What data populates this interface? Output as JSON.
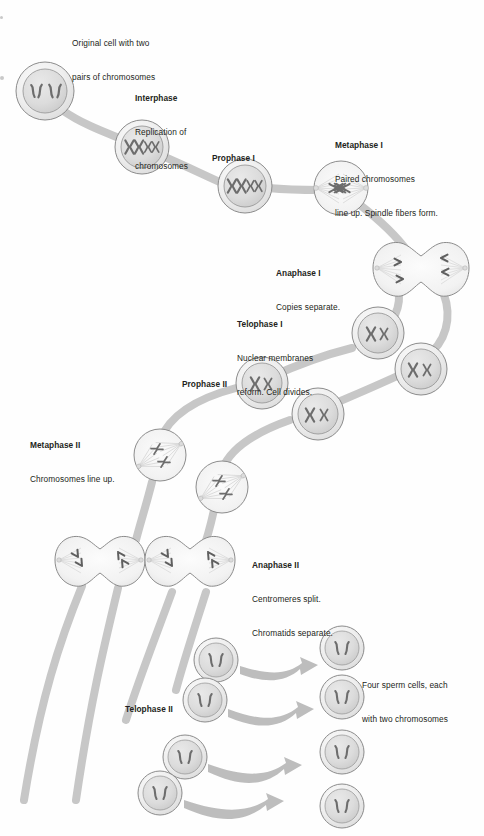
{
  "figure": {
    "type": "biology-process-diagram",
    "background_color": "#fefefe",
    "ink_color": "#231f20",
    "connector_color": "#c5c5c5",
    "cell_fill": "#eeeeee",
    "nucleus_fill": "#dcdcdc",
    "chromosome_color": "#6f6f6f"
  },
  "labels": {
    "original_cell": {
      "header": "",
      "lines": [
        "Original cell with two",
        "pairs of chromosomes"
      ]
    },
    "interphase": {
      "header": "Interphase",
      "lines": [
        "Replication of",
        "chromosomes"
      ]
    },
    "prophase_1": {
      "header": "Prophase I",
      "lines": []
    },
    "metaphase_1": {
      "header": "Metaphase I",
      "lines": [
        "Paired chromosomes",
        "line up. Spindle fibers form."
      ]
    },
    "anaphase_1": {
      "header": "Anaphase I",
      "lines": [
        "Copies separate."
      ]
    },
    "telophase_1": {
      "header": "Telophase I",
      "lines": [
        "Nuclear membranes",
        "reform. Cell divides."
      ]
    },
    "prophase_2": {
      "header": "Prophase II",
      "lines": []
    },
    "metaphase_2": {
      "header": "Metaphase II",
      "lines": [
        "Chromosomes line up."
      ]
    },
    "anaphase_2": {
      "header": "Anaphase II",
      "lines": [
        "Centromeres split.",
        "Chromatids separate."
      ]
    },
    "telophase_2": {
      "header": "Telophase II",
      "lines": []
    },
    "result": {
      "header": "",
      "lines": [
        "Four sperm cells, each",
        "with two chromosomes"
      ]
    }
  },
  "stages": [
    {
      "id": "original-cell",
      "label_key": "original_cell",
      "cells": 1,
      "chromosomes_per_cell": 4,
      "chromosome_form": "unreplicated-rod"
    },
    {
      "id": "interphase",
      "label_key": "interphase",
      "cells": 1,
      "chromosomes_per_cell": 4,
      "chromosome_form": "replicated-X"
    },
    {
      "id": "prophase-1",
      "label_key": "prophase_1",
      "cells": 1,
      "chromosomes_per_cell": 4,
      "chromosome_form": "replicated-X"
    },
    {
      "id": "metaphase-1",
      "label_key": "metaphase_1",
      "cells": 1,
      "chromosomes_per_cell": 4,
      "chromosome_form": "aligned-paired",
      "spindle": true
    },
    {
      "id": "anaphase-1",
      "label_key": "anaphase_1",
      "cells": 1,
      "shape": "dumbbell",
      "chromosomes_per_pole": 2,
      "spindle": true
    },
    {
      "id": "telophase-1",
      "label_key": "telophase_1",
      "cells": 2,
      "chromosomes_per_cell": 2,
      "chromosome_form": "replicated-X"
    },
    {
      "id": "prophase-2",
      "label_key": "prophase_2",
      "cells": 2,
      "chromosomes_per_cell": 2,
      "chromosome_form": "replicated-X"
    },
    {
      "id": "metaphase-2",
      "label_key": "metaphase_2",
      "cells": 2,
      "chromosomes_per_cell": 2,
      "chromosome_form": "aligned",
      "spindle": true
    },
    {
      "id": "anaphase-2",
      "label_key": "anaphase_2",
      "cells": 2,
      "shape": "dumbbell",
      "chromosomes_per_pole": 2,
      "spindle": true
    },
    {
      "id": "telophase-2",
      "label_key": "telophase_2",
      "cells": 4,
      "chromosomes_per_cell": 2,
      "chromosome_form": "unreplicated-rod"
    },
    {
      "id": "sperm-cells",
      "label_key": "result",
      "cells": 4,
      "chromosomes_per_cell": 2,
      "chromosome_form": "unreplicated-rod"
    }
  ]
}
